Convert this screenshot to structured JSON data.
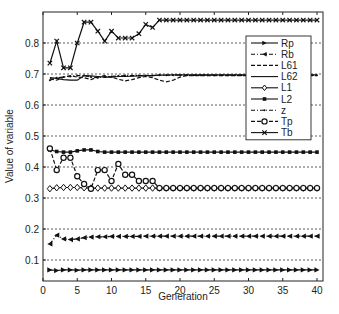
{
  "chart_data": {
    "type": "line",
    "title": "",
    "xlabel": "Generation",
    "ylabel": "Value of variable",
    "xlim": [
      0,
      40
    ],
    "ylim": [
      0.03,
      0.9
    ],
    "xticks": [
      0,
      5,
      10,
      15,
      20,
      25,
      30,
      35,
      40
    ],
    "xtick_labels": [
      "0",
      "5",
      "10",
      "15",
      "20",
      "25",
      "30",
      "35",
      "40"
    ],
    "yticks": [
      0.1,
      0.2,
      0.3,
      0.4,
      0.5,
      0.6,
      0.7,
      0.8
    ],
    "ytick_labels": [
      "0.1",
      "0.2",
      "0.3",
      "0.4",
      "0.5",
      "0.6",
      "0.7",
      "0.8"
    ],
    "grid": "horizontal-dotted",
    "legend_position": "top-right",
    "x": [
      1,
      2,
      3,
      4,
      5,
      6,
      7,
      8,
      9,
      10,
      11,
      12,
      13,
      14,
      15,
      16,
      17,
      18,
      19,
      20,
      21,
      22,
      23,
      24,
      25,
      26,
      27,
      28,
      29,
      30,
      31,
      32,
      33,
      34,
      35,
      36,
      37,
      38,
      39,
      40
    ],
    "series": [
      {
        "name": "Rp",
        "marker": "triangle-right",
        "dash": "solid",
        "values": [
          0.068,
          0.066,
          0.068,
          0.068,
          0.067,
          0.068,
          0.068,
          0.068,
          0.068,
          0.068,
          0.068,
          0.068,
          0.068,
          0.068,
          0.068,
          0.068,
          0.068,
          0.068,
          0.068,
          0.068,
          0.068,
          0.068,
          0.068,
          0.068,
          0.068,
          0.068,
          0.068,
          0.068,
          0.068,
          0.068,
          0.068,
          0.068,
          0.068,
          0.068,
          0.068,
          0.068,
          0.068,
          0.068,
          0.068,
          0.068
        ]
      },
      {
        "name": "Rb",
        "marker": "triangle-left",
        "dash": "dashdot",
        "values": [
          0.152,
          0.18,
          0.168,
          0.166,
          0.168,
          0.172,
          0.174,
          0.175,
          0.175,
          0.176,
          0.176,
          0.176,
          0.176,
          0.176,
          0.177,
          0.177,
          0.177,
          0.177,
          0.177,
          0.177,
          0.177,
          0.177,
          0.177,
          0.177,
          0.177,
          0.177,
          0.177,
          0.177,
          0.177,
          0.177,
          0.177,
          0.177,
          0.177,
          0.177,
          0.177,
          0.177,
          0.177,
          0.177,
          0.177,
          0.177
        ]
      },
      {
        "name": "L61",
        "marker": "none",
        "dash": "dashed",
        "values": [
          0.685,
          0.68,
          0.69,
          0.695,
          0.69,
          0.688,
          0.682,
          0.69,
          0.695,
          0.69,
          0.683,
          0.678,
          0.682,
          0.688,
          0.692,
          0.688,
          0.68,
          0.675,
          0.68,
          0.69,
          0.695,
          0.695,
          0.695,
          0.695,
          0.695,
          0.695,
          0.695,
          0.695,
          0.695,
          0.695,
          0.695,
          0.695,
          0.695,
          0.695,
          0.695,
          0.695,
          0.695,
          0.695,
          0.695,
          0.695
        ]
      },
      {
        "name": "L62",
        "marker": "none",
        "dash": "solid",
        "values": [
          0.688,
          0.686,
          0.682,
          0.68,
          0.68,
          0.695,
          0.694,
          0.692,
          0.69,
          0.69,
          0.692,
          0.692,
          0.693,
          0.694,
          0.695,
          0.695,
          0.696,
          0.696,
          0.697,
          0.697,
          0.697,
          0.697,
          0.697,
          0.697,
          0.697,
          0.697,
          0.697,
          0.697,
          0.697,
          0.697,
          0.697,
          0.697,
          0.697,
          0.697,
          0.697,
          0.697,
          0.697,
          0.697,
          0.697,
          0.697
        ]
      },
      {
        "name": "L1",
        "marker": "diamond",
        "dash": "solid",
        "values": [
          0.33,
          0.333,
          0.334,
          0.334,
          0.334,
          0.333,
          0.332,
          0.332,
          0.332,
          0.332,
          0.332,
          0.332,
          0.332,
          0.332,
          0.332,
          0.332,
          0.332,
          0.332,
          0.332,
          0.332,
          0.332,
          0.332,
          0.332,
          0.332,
          0.332,
          0.332,
          0.332,
          0.332,
          0.332,
          0.332,
          0.332,
          0.332,
          0.332,
          0.332,
          0.332,
          0.332,
          0.332,
          0.332,
          0.332,
          0.332
        ]
      },
      {
        "name": "L2",
        "marker": "square",
        "dash": "solid",
        "values": [
          0.455,
          0.45,
          0.448,
          0.448,
          0.452,
          0.455,
          0.455,
          0.45,
          0.448,
          0.448,
          0.448,
          0.448,
          0.448,
          0.448,
          0.448,
          0.448,
          0.448,
          0.448,
          0.448,
          0.448,
          0.448,
          0.448,
          0.448,
          0.448,
          0.448,
          0.448,
          0.448,
          0.448,
          0.448,
          0.448,
          0.448,
          0.448,
          0.448,
          0.448,
          0.448,
          0.448,
          0.448,
          0.448,
          0.448,
          0.448
        ]
      },
      {
        "name": "z",
        "marker": "dot",
        "dash": "dashdot",
        "values": [
          0.68,
          0.688,
          0.69,
          0.692,
          0.695,
          0.695,
          0.69,
          0.688,
          0.69,
          0.692,
          0.694,
          0.695,
          0.695,
          0.695,
          0.695,
          0.695,
          0.696,
          0.696,
          0.696,
          0.696,
          0.696,
          0.696,
          0.696,
          0.696,
          0.696,
          0.696,
          0.696,
          0.696,
          0.696,
          0.696,
          0.696,
          0.696,
          0.696,
          0.696,
          0.696,
          0.696,
          0.696,
          0.696,
          0.696,
          0.696
        ]
      },
      {
        "name": "Tp",
        "marker": "circle",
        "dash": "dashed",
        "values": [
          0.46,
          0.39,
          0.43,
          0.43,
          0.37,
          0.345,
          0.33,
          0.39,
          0.39,
          0.355,
          0.41,
          0.375,
          0.375,
          0.355,
          0.355,
          0.355,
          0.332,
          0.332,
          0.332,
          0.332,
          0.332,
          0.332,
          0.332,
          0.332,
          0.332,
          0.332,
          0.332,
          0.332,
          0.332,
          0.332,
          0.332,
          0.332,
          0.332,
          0.332,
          0.332,
          0.332,
          0.332,
          0.332,
          0.332,
          0.332
        ]
      },
      {
        "name": "Tb",
        "marker": "x",
        "dash": "solid",
        "values": [
          0.735,
          0.806,
          0.72,
          0.72,
          0.8,
          0.867,
          0.867,
          0.838,
          0.806,
          0.838,
          0.816,
          0.816,
          0.816,
          0.83,
          0.86,
          0.85,
          0.874,
          0.874,
          0.874,
          0.874,
          0.874,
          0.874,
          0.874,
          0.874,
          0.874,
          0.874,
          0.874,
          0.874,
          0.874,
          0.874,
          0.874,
          0.874,
          0.874,
          0.874,
          0.874,
          0.874,
          0.874,
          0.874,
          0.874,
          0.874
        ]
      }
    ]
  }
}
